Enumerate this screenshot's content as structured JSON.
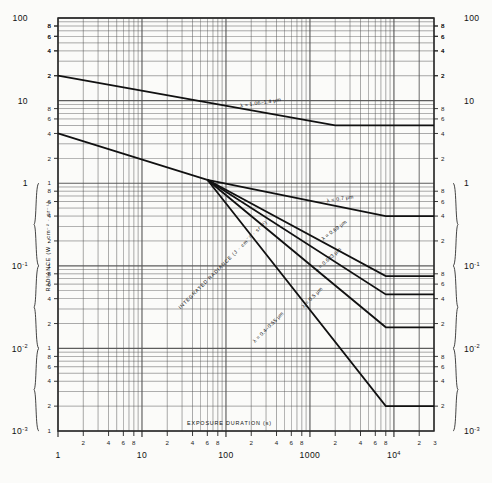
{
  "figure": {
    "background": "#fbfbf9",
    "ink": "#1a1a1a",
    "grid_color": "#555555"
  },
  "axes": {
    "x": {
      "title": "EXPOSURE DURATION (s)",
      "scale": "log",
      "min": 1,
      "max": 30000,
      "decade_labels": [
        "1",
        "10",
        "100",
        "1000",
        "10",
        "3"
      ],
      "decade_label_10k_base": "10",
      "decade_label_10k_exp": "4",
      "minor_ticks": [
        "2",
        "4",
        "6",
        "8"
      ]
    },
    "y": {
      "title": "RADIANCE (W · cm",
      "title_full": "RADIANCE (W · cm-2 · sr-1)",
      "title_secondary": "INTEGRATED RADIANCE (J · cm-2 · sr-1)",
      "scale": "log",
      "min": 0.001,
      "max": 100,
      "decade_labels": [
        "100",
        "10",
        "1",
        "10-1",
        "10-2",
        "10-3"
      ],
      "minor_ticks": [
        "2",
        "4",
        "6",
        "8"
      ]
    }
  },
  "chart_data": {
    "type": "line",
    "title": "",
    "subtitle": "",
    "xlabel": "EXPOSURE DURATION (s)",
    "ylabel": "RADIANCE (W · cm-2 · sr-1)",
    "ylabel_secondary": "INTEGRATED RADIANCE (J · cm-2 · sr-1)",
    "xscale": "log",
    "yscale": "log",
    "xlim": [
      1,
      30000
    ],
    "ylim": [
      0.001,
      100
    ],
    "grid": true,
    "legend": "inline-annotations",
    "series": [
      {
        "name": "lambda = 1.06-1.4 um",
        "label": "λ = 1.06–1.4 μm",
        "label_x": 260,
        "label_y": 9.0,
        "label_rotation": -9,
        "points": [
          [
            1,
            20
          ],
          [
            2000,
            5.0
          ],
          [
            30000,
            5.0
          ]
        ]
      },
      {
        "name": "lambda = 0.7 um",
        "label": "λ = 0.7 μm",
        "label_x": 2300,
        "label_y": 0.62,
        "label_rotation": -9,
        "points": [
          [
            1,
            4.0
          ],
          [
            60,
            1.1
          ],
          [
            8000,
            0.4
          ],
          [
            30000,
            0.4
          ]
        ]
      },
      {
        "name": "lambda = 0.69 um",
        "label": "λ = 0.69 μm",
        "label_x": 2000,
        "label_y": 0.26,
        "label_rotation": -37,
        "points": [
          [
            60,
            1.1
          ],
          [
            8000,
            0.075
          ],
          [
            30000,
            0.075
          ]
        ]
      },
      {
        "name": "lambda = 0.633 um",
        "label": "λ = 0.633 μm",
        "label_x": 1700,
        "label_y": 0.115,
        "label_rotation": -42,
        "points": [
          [
            60,
            1.1
          ],
          [
            8000,
            0.045
          ],
          [
            30000,
            0.045
          ]
        ]
      },
      {
        "name": "lambda = 0.5 um",
        "label": "λ = 0.5 μm",
        "label_x": 1100,
        "label_y": 0.04,
        "label_rotation": -45,
        "points": [
          [
            60,
            1.1
          ],
          [
            8000,
            0.018
          ],
          [
            30000,
            0.018
          ]
        ]
      },
      {
        "name": "lambda = 0.4-0.55 um (integrated)",
        "label": "λ = 0.4–0.55 μm",
        "label_x": 330,
        "label_y": 0.0175,
        "label_rotation": -45,
        "points": [
          [
            60,
            1.1
          ],
          [
            8000,
            0.002
          ],
          [
            30000,
            0.002
          ]
        ]
      }
    ],
    "annotations": [
      {
        "text": "INTEGRATED RADIANCE (J · cm",
        "text_full": "INTEGRATED RADIANCE (J · cm⁻² · sr⁻¹)",
        "x": 95,
        "y": 0.1,
        "rotation": -45
      }
    ]
  },
  "labels": {
    "y_axis_main": "RADIANCE (W",
    "y_axis_sup1": "-2",
    "y_axis_sup2": "-1",
    "y_axis_cm": "cm",
    "y_axis_sr": "sr",
    "integrated_main": "INTEGRATED RADIANCE (J",
    "x_axis_title": "EXPOSURE DURATION (s)"
  },
  "y_decades": [
    {
      "label": "100",
      "exp": "",
      "value": 100
    },
    {
      "label": "10",
      "exp": "",
      "value": 10
    },
    {
      "label": "1",
      "exp": "",
      "value": 1
    },
    {
      "label": "10",
      "exp": "-1",
      "value": 0.1
    },
    {
      "label": "10",
      "exp": "-2",
      "value": 0.01
    },
    {
      "label": "10",
      "exp": "-3",
      "value": 0.001
    }
  ],
  "x_decades": [
    {
      "label": "1",
      "exp": "",
      "value": 1
    },
    {
      "label": "10",
      "exp": "",
      "value": 10
    },
    {
      "label": "100",
      "exp": "",
      "value": 100
    },
    {
      "label": "1000",
      "exp": "",
      "value": 1000
    },
    {
      "label": "10",
      "exp": "4",
      "value": 10000
    }
  ],
  "x_end_tick": "3"
}
